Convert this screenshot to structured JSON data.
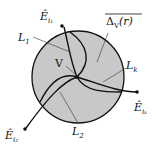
{
  "diagram": {
    "circle_label": "Δ",
    "circle_label_sub": "V",
    "circle_label_arg": "(r)",
    "vertex_label": "V",
    "endpoints": [
      {
        "base": "Ê",
        "sub": "i₁"
      },
      {
        "base": "Ê",
        "sub": "i₂"
      },
      {
        "base": "Ê",
        "sub": "iₖ"
      }
    ],
    "curves": [
      {
        "base": "L",
        "sub": "1"
      },
      {
        "base": "L",
        "sub": "2"
      },
      {
        "base": "L",
        "sub": "k"
      }
    ],
    "colors": {
      "disc_fill": "#c8c8c8",
      "stroke": "#111111"
    }
  }
}
